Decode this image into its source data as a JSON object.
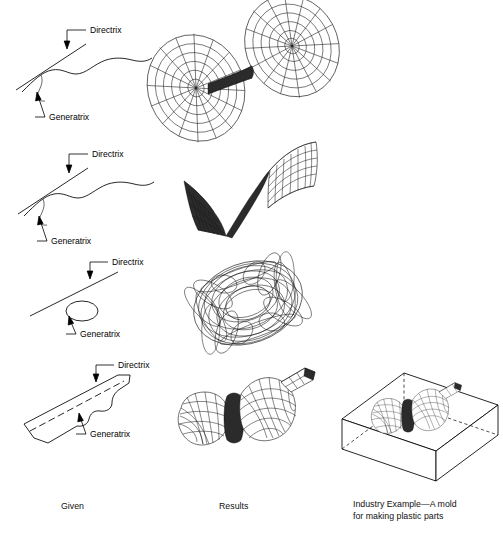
{
  "figure": {
    "background_color": "#ffffff",
    "line_color": "#000000"
  },
  "columns": [
    {
      "id": "given",
      "caption": "Given"
    },
    {
      "id": "results",
      "caption": "Results"
    },
    {
      "id": "industry",
      "caption": "Industry Example—A mold\nfor making plastic parts"
    }
  ],
  "rows": [
    {
      "id": "row-1",
      "given": {
        "directrix_label": "Directrix",
        "generatrix_label": "Generatrix",
        "directrix_type": "straight-line",
        "generatrix_type": "wavy-curve"
      },
      "result": {
        "label": "double-lobed surface of revolution",
        "shape": "twin-disc-wireframe"
      }
    },
    {
      "id": "row-2",
      "given": {
        "directrix_label": "Directrix",
        "generatrix_label": "Generatrix",
        "directrix_type": "straight-line",
        "generatrix_type": "wavy-curve"
      },
      "result": {
        "label": "ruled swept sheet surface",
        "shape": "s-curve-ruled-sheet"
      }
    },
    {
      "id": "row-3",
      "given": {
        "directrix_label": "Directrix",
        "generatrix_label": "Generatrix",
        "directrix_type": "straight-line",
        "generatrix_type": "ellipse"
      },
      "result": {
        "label": "torus",
        "shape": "torus-wireframe"
      }
    },
    {
      "id": "row-4",
      "given": {
        "directrix_label": "Directrix",
        "generatrix_label": "Generatrix",
        "directrix_type": "dashed-line",
        "generatrix_type": "bottle-profile"
      },
      "result": {
        "label": "bottle-shaped swept solid",
        "shape": "bottle-wireframe"
      }
    }
  ],
  "industry_example": {
    "caption_line_1": "Industry Example—A mold",
    "caption_line_2": "for making plastic parts",
    "block_label": "rectangular mold block",
    "cavity_label": "bottle cavity"
  }
}
